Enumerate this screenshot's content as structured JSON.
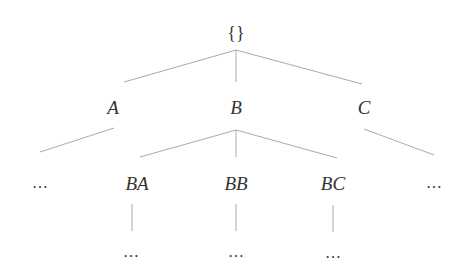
{
  "diagram": {
    "type": "tree",
    "root": {
      "label": "{}"
    },
    "level1": [
      {
        "label": "A"
      },
      {
        "label": "B"
      },
      {
        "label": "C"
      }
    ],
    "level2": [
      {
        "label": "..."
      },
      {
        "label": "BA"
      },
      {
        "label": "BB"
      },
      {
        "label": "BC"
      },
      {
        "label": "..."
      }
    ],
    "level3": [
      {
        "label": "..."
      },
      {
        "label": "..."
      },
      {
        "label": "..."
      }
    ],
    "colors": {
      "line": "#aaaaaa",
      "text": "#333333"
    }
  }
}
